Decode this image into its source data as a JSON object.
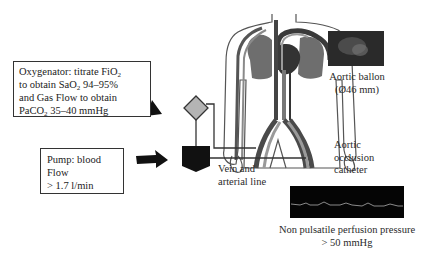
{
  "oxygenator_box": {
    "line1_prefix": "Oxygenator: titrate FiO",
    "line1_sub": "2",
    "line2_prefix": "to obtain SaO",
    "line2_sub": "2",
    "line2_suffix": " 94–95%",
    "line3": "and Gas Flow to obtain",
    "line4_prefix": "PaCO",
    "line4_sub": "2",
    "line4_suffix": " 35–40 mmHg"
  },
  "pump_box": {
    "line1": "Pump: blood",
    "line2": "Flow",
    "line3": "> 1.7 l/min"
  },
  "labels": {
    "aortic_balloon_1": "Aortic ballon",
    "aortic_balloon_2": "(Ø46 mm)",
    "occlusion_1": "Aortic",
    "occlusion_2": "occlusion",
    "occlusion_3": "catheter",
    "vein_line_1": "Vein and",
    "vein_line_2": "arterial line",
    "perfusion_1": "Non pulsatile perfusion pressure",
    "perfusion_2": "> 50 mmHg"
  },
  "icons": {
    "oxygenator": "diamond-icon",
    "pump": "pentagon-pump-icon",
    "arrow": "thick-arrow-icon"
  },
  "colors": {
    "organ_gray": "#6e6e6e",
    "vessel_dark": "#3a3a3a",
    "vessel_light": "#9a9a9a",
    "diamond_fill": "#b4b4b4",
    "monitor_bg": "#050505"
  }
}
